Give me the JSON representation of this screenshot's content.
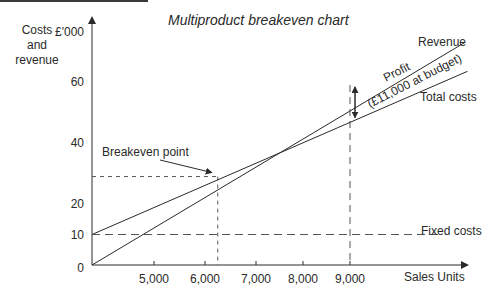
{
  "chart_data": {
    "type": "line",
    "title": "Multiproduct breakeven chart",
    "ylabel": "Costs and revenue",
    "ylabel_unit": "£'000",
    "xlabel": "Sales Units",
    "yticks": [
      0,
      10,
      20,
      40,
      60
    ],
    "ytick_labels": [
      "0",
      "10",
      "20",
      "40",
      "60"
    ],
    "xticks": [
      5000,
      6000,
      7000,
      8000,
      9000
    ],
    "xtick_labels": [
      "5,000",
      "6,000",
      "7,000",
      "8,000",
      "9,000"
    ],
    "x_axis_scale_points": [
      [
        0,
        0
      ],
      [
        5000,
        5000
      ],
      [
        6000,
        6000
      ],
      [
        7000,
        7000
      ],
      [
        8000,
        8000
      ],
      [
        9000,
        9000
      ]
    ],
    "ylim": [
      0,
      75
    ],
    "xlim": [
      0,
      11500
    ],
    "grid": false,
    "series": [
      {
        "name": "Revenue",
        "label": "Revenue",
        "style": "solid",
        "points": [
          [
            0,
            0
          ],
          [
            11300,
            73
          ]
        ]
      },
      {
        "name": "Total costs",
        "label": "Total costs",
        "style": "solid",
        "points": [
          [
            0,
            10
          ],
          [
            11350,
            63.5
          ]
        ]
      },
      {
        "name": "Fixed costs",
        "label": "Fixed costs",
        "style": "dashed",
        "points": [
          [
            0,
            10
          ],
          [
            10800,
            10
          ]
        ]
      }
    ],
    "breakeven": {
      "label": "Breakeven point",
      "x": 6250,
      "y": 29
    },
    "budget": {
      "x": 9000,
      "revenue": 59,
      "total_costs": 48
    },
    "annotations": {
      "profit_line1": "Profit",
      "profit_line2": "(£11,000 at budget)"
    }
  }
}
